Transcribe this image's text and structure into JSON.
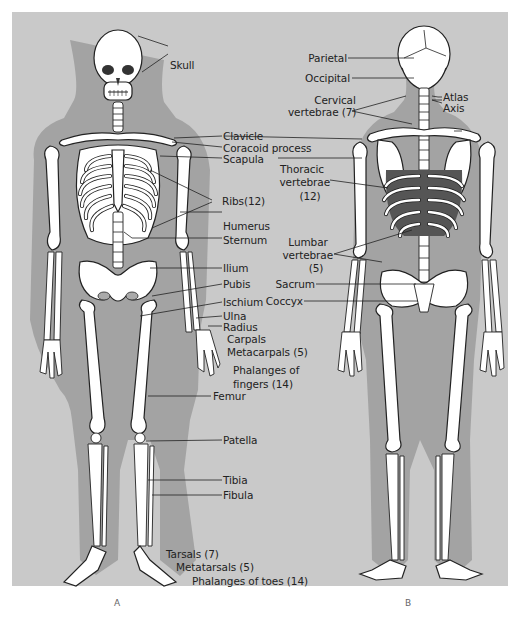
{
  "figure": {
    "panel_color": "#c9c9c9",
    "shadow_color": "#9a9a9a",
    "bone_color": "#ffffff",
    "outline_color": "#222222",
    "views": [
      {
        "id": "A",
        "caption": "A",
        "view": "anterior"
      },
      {
        "id": "B",
        "caption": "B",
        "view": "posterior"
      }
    ]
  },
  "labels_anterior": {
    "skull": "Skull",
    "clavicle": "Clavicle",
    "coracoid": "Coracoid process",
    "scapula": "Scapula",
    "ribs": "Ribs(12)",
    "humerus": "Humerus",
    "sternum": "Sternum",
    "ilium": "Ilium",
    "pubis": "Pubis",
    "ischium": "Ischium",
    "ulna": "Ulna",
    "radius": "Radius",
    "carpals": "Carpals",
    "metacarpals": "Metacarpals (5)",
    "phalanges_fingers_1": "Phalanges of",
    "phalanges_fingers_2": "fingers (14)",
    "femur": "Femur",
    "patella": "Patella",
    "tibia": "Tibia",
    "fibula": "Fibula",
    "tarsals": "Tarsals (7)",
    "metatarsals": "Metatarsals (5)",
    "phalanges_toes": "Phalanges of toes (14)"
  },
  "labels_posterior": {
    "parietal": "Parietal",
    "occipital": "Occipital",
    "atlas": "Atlas",
    "axis": "Axis",
    "cervical_1": "Cervical",
    "cervical_2": "vertebrae (7)",
    "thoracic_1": "Thoracic",
    "thoracic_2": "vertebrae",
    "thoracic_3": "(12)",
    "lumbar_1": "Lumbar",
    "lumbar_2": "vertebrae",
    "lumbar_3": "(5)",
    "sacrum": "Sacrum",
    "coccyx": "Coccyx"
  }
}
